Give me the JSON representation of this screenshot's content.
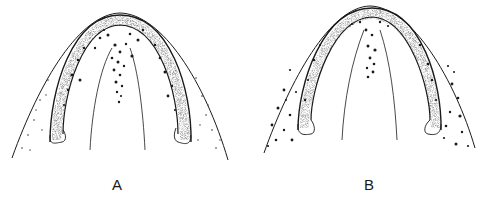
{
  "figure": {
    "type": "stippled scientific illustration",
    "panels": [
      {
        "id": "A",
        "label": "A"
      },
      {
        "id": "B",
        "label": "B"
      }
    ],
    "colors": {
      "ink": "#1a1a1a",
      "background": "#ffffff"
    }
  }
}
